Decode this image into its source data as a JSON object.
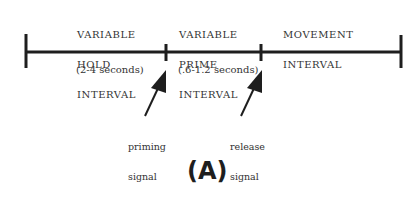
{
  "diagram": {
    "intervals": [
      {
        "title_lines": [
          "VARIABLE",
          "HOLD",
          "INTERVAL"
        ],
        "duration": "(2-4 seconds)"
      },
      {
        "title_lines": [
          "VARIABLE",
          "PRIME",
          "INTERVAL"
        ],
        "duration": "(.6-1.2 seconds)"
      },
      {
        "title_lines": [
          "MOVEMENT",
          "INTERVAL"
        ],
        "duration": ""
      }
    ],
    "signals": [
      {
        "lines": [
          "priming",
          "signal"
        ]
      },
      {
        "lines": [
          "release",
          "signal"
        ]
      }
    ],
    "panel_label": "(A)",
    "colors": {
      "line": "#1e1e1e",
      "text": "#333333"
    }
  }
}
